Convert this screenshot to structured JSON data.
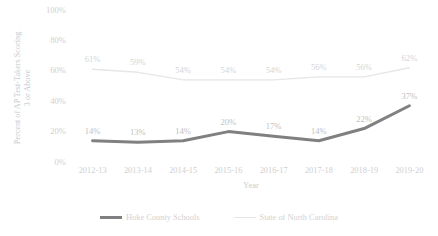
{
  "chart_data": {
    "type": "line",
    "title": "",
    "xlabel": "Year",
    "ylabel_line1": "Percent of AP Test-Takers Scoring",
    "ylabel_line2": "3 or Above",
    "categories": [
      "2012-13",
      "2013-14",
      "2014-15",
      "2015-16",
      "2016-17",
      "2017-18",
      "2018-19",
      "2019-20"
    ],
    "ylim": [
      0,
      100
    ],
    "yticks": [
      "0%",
      "20%",
      "40%",
      "60%",
      "80%",
      "100%"
    ],
    "ytick_values": [
      0,
      20,
      40,
      60,
      80,
      100
    ],
    "grid": false,
    "legend_position": "bottom",
    "series": [
      {
        "name": "Hoke County Schools",
        "color": "#808080",
        "width": 3,
        "values": [
          14,
          13,
          14,
          20,
          17,
          14,
          22,
          37
        ],
        "labels": [
          "14%",
          "13%",
          "14%",
          "20%",
          "17%",
          "14%",
          "22%",
          "37%"
        ]
      },
      {
        "name": "State of North Carolina",
        "color": "#e6e6e6",
        "width": 1.4,
        "values": [
          61,
          59,
          54,
          54,
          54,
          56,
          56,
          62
        ],
        "labels": [
          "61%",
          "59%",
          "54%",
          "54%",
          "54%",
          "56%",
          "56%",
          "62%"
        ]
      }
    ]
  },
  "legend": {
    "items": [
      {
        "label": "Hoke County Schools"
      },
      {
        "label": "State of North Carolina"
      }
    ]
  },
  "axes": {
    "x_title": "Year",
    "y_title_line1": "Percent of AP Test-Takers Scoring",
    "y_title_line2": "3 or Above"
  }
}
